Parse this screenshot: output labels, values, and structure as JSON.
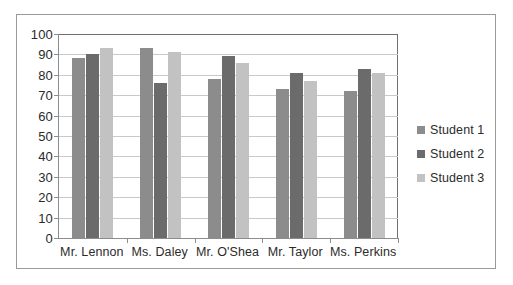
{
  "chart_data": {
    "type": "bar",
    "title": "",
    "subtitle": "",
    "xlabel": "",
    "ylabel": "",
    "ylim": [
      0,
      100
    ],
    "ytick_step": 10,
    "yticks": [
      "100",
      "90",
      "80",
      "70",
      "60",
      "50",
      "40",
      "30",
      "20",
      "10",
      "0"
    ],
    "grid": true,
    "legend_position": "right",
    "categories": [
      "Mr. Lennon",
      "Ms. Daley",
      "Mr. O'Shea",
      "Mr. Taylor",
      "Ms. Perkins"
    ],
    "series": [
      {
        "name": "Student 1",
        "color": "#8c8c8c",
        "values": [
          88,
          93,
          78,
          73,
          72
        ]
      },
      {
        "name": "Student 2",
        "color": "#6b6b6b",
        "values": [
          90,
          76,
          89,
          81,
          83
        ]
      },
      {
        "name": "Student 3",
        "color": "#c2c2c2",
        "values": [
          93,
          91,
          86,
          77,
          81
        ]
      }
    ]
  },
  "legend": {
    "items": [
      {
        "label": "Student 1"
      },
      {
        "label": "Student 2"
      },
      {
        "label": "Student 3"
      }
    ]
  },
  "colors": {
    "series_1": "#8c8c8c",
    "series_2": "#6b6b6b",
    "series_3": "#c2c2c2",
    "axis": "#8d8d8d",
    "gridline": "#c9c9c9",
    "frame": "#9a9a9a",
    "text": "#2b2b2b",
    "background": "#ffffff"
  }
}
